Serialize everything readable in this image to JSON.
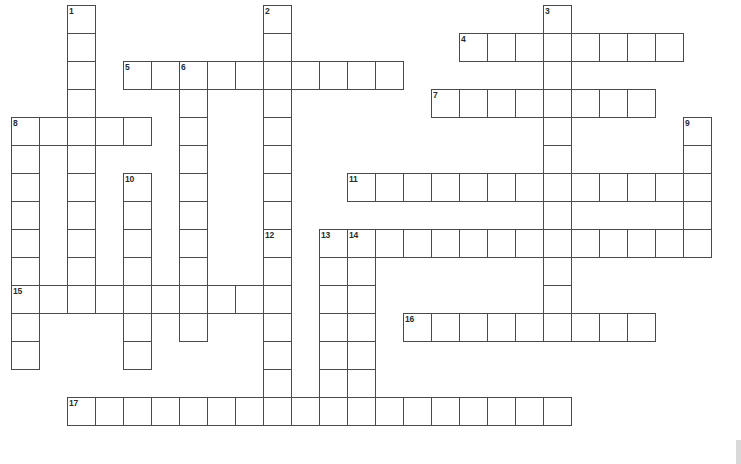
{
  "puzzle": {
    "title": "Crossword Puzzle Grid",
    "kind": "crossword-grid",
    "width_px": 741,
    "height_px": 464,
    "cell_size_px": 28,
    "origin_x_px": 11,
    "origin_y_px": 5,
    "columns": 26,
    "rows": 16,
    "background_color": "#ffffff",
    "grid_line_color": "#4a4a4a",
    "number_color": "#2b2b2b",
    "total_clue_numbers": 17,
    "entries": [
      {
        "number": "1",
        "direction": "down",
        "col": 3,
        "row": 1,
        "length": 8
      },
      {
        "number": "2",
        "direction": "down",
        "col": 10,
        "row": 1,
        "length": 7
      },
      {
        "number": "3",
        "direction": "down",
        "col": 20,
        "row": 1,
        "length": 10
      },
      {
        "number": "4",
        "direction": "across",
        "col": 17,
        "row": 2,
        "length": 8
      },
      {
        "number": "5",
        "direction": "across",
        "col": 5,
        "row": 3,
        "length": 10
      },
      {
        "number": "6",
        "direction": "down",
        "col": 7,
        "row": 3,
        "length": 9
      },
      {
        "number": "7",
        "direction": "across",
        "col": 16,
        "row": 4,
        "length": 8
      },
      {
        "number": "8",
        "direction": "across",
        "col": 1,
        "row": 5,
        "length": 5
      },
      {
        "number": "8",
        "direction": "down",
        "col": 1,
        "row": 5,
        "length": 8
      },
      {
        "number": "9",
        "direction": "down",
        "col": 25,
        "row": 5,
        "length": 5
      },
      {
        "number": "10",
        "direction": "down",
        "col": 5,
        "row": 6,
        "length": 7
      },
      {
        "number": "11",
        "direction": "across",
        "col": 13,
        "row": 7,
        "length": 12
      },
      {
        "number": "12",
        "direction": "down",
        "col": 10,
        "row": 9,
        "length": 8
      },
      {
        "number": "13",
        "direction": "down",
        "col": 12,
        "row": 9,
        "length": 8
      },
      {
        "number": "14",
        "direction": "across",
        "col": 13,
        "row": 9,
        "length": 13
      },
      {
        "number": "14",
        "direction": "down",
        "col": 13,
        "row": 9,
        "length": 8
      },
      {
        "number": "15",
        "direction": "across",
        "col": 1,
        "row": 11,
        "length": 10
      },
      {
        "number": "16",
        "direction": "across",
        "col": 15,
        "row": 12,
        "length": 9
      },
      {
        "number": "17",
        "direction": "across",
        "col": 3,
        "row": 15,
        "length": 18
      }
    ],
    "cells": [
      {
        "col": 3,
        "row": 1,
        "number": "1"
      },
      {
        "col": 10,
        "row": 1,
        "number": "2"
      },
      {
        "col": 20,
        "row": 1,
        "number": "3"
      },
      {
        "col": 3,
        "row": 2
      },
      {
        "col": 10,
        "row": 2
      },
      {
        "col": 20,
        "row": 2
      },
      {
        "col": 17,
        "row": 2,
        "number": "4"
      },
      {
        "col": 18,
        "row": 2
      },
      {
        "col": 19,
        "row": 2
      },
      {
        "col": 21,
        "row": 2
      },
      {
        "col": 22,
        "row": 2
      },
      {
        "col": 23,
        "row": 2
      },
      {
        "col": 24,
        "row": 2
      },
      {
        "col": 3,
        "row": 3
      },
      {
        "col": 5,
        "row": 3,
        "number": "5"
      },
      {
        "col": 6,
        "row": 3
      },
      {
        "col": 7,
        "row": 3,
        "number": "6"
      },
      {
        "col": 8,
        "row": 3
      },
      {
        "col": 9,
        "row": 3
      },
      {
        "col": 10,
        "row": 3
      },
      {
        "col": 11,
        "row": 3
      },
      {
        "col": 12,
        "row": 3
      },
      {
        "col": 13,
        "row": 3
      },
      {
        "col": 14,
        "row": 3
      },
      {
        "col": 20,
        "row": 3
      },
      {
        "col": 3,
        "row": 4
      },
      {
        "col": 7,
        "row": 4
      },
      {
        "col": 10,
        "row": 4
      },
      {
        "col": 16,
        "row": 4,
        "number": "7"
      },
      {
        "col": 17,
        "row": 4
      },
      {
        "col": 18,
        "row": 4
      },
      {
        "col": 19,
        "row": 4
      },
      {
        "col": 20,
        "row": 4
      },
      {
        "col": 21,
        "row": 4
      },
      {
        "col": 22,
        "row": 4
      },
      {
        "col": 23,
        "row": 4
      },
      {
        "col": 1,
        "row": 5,
        "number": "8"
      },
      {
        "col": 2,
        "row": 5
      },
      {
        "col": 3,
        "row": 5
      },
      {
        "col": 4,
        "row": 5
      },
      {
        "col": 5,
        "row": 5
      },
      {
        "col": 7,
        "row": 5
      },
      {
        "col": 10,
        "row": 5
      },
      {
        "col": 20,
        "row": 5
      },
      {
        "col": 25,
        "row": 5,
        "number": "9"
      },
      {
        "col": 1,
        "row": 6
      },
      {
        "col": 3,
        "row": 6
      },
      {
        "col": 7,
        "row": 6
      },
      {
        "col": 10,
        "row": 6
      },
      {
        "col": 20,
        "row": 6
      },
      {
        "col": 25,
        "row": 6
      },
      {
        "col": 1,
        "row": 7
      },
      {
        "col": 3,
        "row": 7
      },
      {
        "col": 5,
        "row": 7,
        "number": "10"
      },
      {
        "col": 7,
        "row": 7
      },
      {
        "col": 10,
        "row": 7
      },
      {
        "col": 13,
        "row": 7,
        "number": "11"
      },
      {
        "col": 14,
        "row": 7
      },
      {
        "col": 15,
        "row": 7
      },
      {
        "col": 16,
        "row": 7
      },
      {
        "col": 17,
        "row": 7
      },
      {
        "col": 18,
        "row": 7
      },
      {
        "col": 19,
        "row": 7
      },
      {
        "col": 20,
        "row": 7
      },
      {
        "col": 21,
        "row": 7
      },
      {
        "col": 22,
        "row": 7
      },
      {
        "col": 23,
        "row": 7
      },
      {
        "col": 24,
        "row": 7
      },
      {
        "col": 25,
        "row": 7
      },
      {
        "col": 1,
        "row": 8
      },
      {
        "col": 3,
        "row": 8
      },
      {
        "col": 5,
        "row": 8
      },
      {
        "col": 7,
        "row": 8
      },
      {
        "col": 10,
        "row": 8
      },
      {
        "col": 20,
        "row": 8
      },
      {
        "col": 25,
        "row": 8
      },
      {
        "col": 1,
        "row": 9
      },
      {
        "col": 3,
        "row": 9
      },
      {
        "col": 5,
        "row": 9
      },
      {
        "col": 7,
        "row": 9
      },
      {
        "col": 10,
        "row": 9,
        "number": "12"
      },
      {
        "col": 12,
        "row": 9,
        "number": "13"
      },
      {
        "col": 13,
        "row": 9,
        "number": "14"
      },
      {
        "col": 14,
        "row": 9
      },
      {
        "col": 15,
        "row": 9
      },
      {
        "col": 16,
        "row": 9
      },
      {
        "col": 17,
        "row": 9
      },
      {
        "col": 18,
        "row": 9
      },
      {
        "col": 19,
        "row": 9
      },
      {
        "col": 20,
        "row": 9
      },
      {
        "col": 21,
        "row": 9
      },
      {
        "col": 22,
        "row": 9
      },
      {
        "col": 23,
        "row": 9
      },
      {
        "col": 24,
        "row": 9
      },
      {
        "col": 25,
        "row": 9
      },
      {
        "col": 1,
        "row": 10
      },
      {
        "col": 3,
        "row": 10
      },
      {
        "col": 5,
        "row": 10
      },
      {
        "col": 7,
        "row": 10
      },
      {
        "col": 10,
        "row": 10
      },
      {
        "col": 12,
        "row": 10
      },
      {
        "col": 13,
        "row": 10
      },
      {
        "col": 20,
        "row": 10
      },
      {
        "col": 1,
        "row": 11,
        "number": "15"
      },
      {
        "col": 2,
        "row": 11
      },
      {
        "col": 3,
        "row": 11
      },
      {
        "col": 4,
        "row": 11
      },
      {
        "col": 5,
        "row": 11
      },
      {
        "col": 6,
        "row": 11
      },
      {
        "col": 7,
        "row": 11
      },
      {
        "col": 8,
        "row": 11
      },
      {
        "col": 9,
        "row": 11
      },
      {
        "col": 10,
        "row": 11
      },
      {
        "col": 12,
        "row": 11
      },
      {
        "col": 13,
        "row": 11
      },
      {
        "col": 20,
        "row": 11
      },
      {
        "col": 1,
        "row": 12
      },
      {
        "col": 5,
        "row": 12
      },
      {
        "col": 7,
        "row": 12
      },
      {
        "col": 10,
        "row": 12
      },
      {
        "col": 12,
        "row": 12
      },
      {
        "col": 13,
        "row": 12
      },
      {
        "col": 15,
        "row": 12,
        "number": "16"
      },
      {
        "col": 16,
        "row": 12
      },
      {
        "col": 17,
        "row": 12
      },
      {
        "col": 18,
        "row": 12
      },
      {
        "col": 19,
        "row": 12
      },
      {
        "col": 20,
        "row": 12
      },
      {
        "col": 21,
        "row": 12
      },
      {
        "col": 22,
        "row": 12
      },
      {
        "col": 23,
        "row": 12
      },
      {
        "col": 1,
        "row": 13
      },
      {
        "col": 5,
        "row": 13
      },
      {
        "col": 10,
        "row": 13
      },
      {
        "col": 12,
        "row": 13
      },
      {
        "col": 13,
        "row": 13
      },
      {
        "col": 10,
        "row": 14
      },
      {
        "col": 12,
        "row": 14
      },
      {
        "col": 13,
        "row": 14
      },
      {
        "col": 3,
        "row": 15,
        "number": "17"
      },
      {
        "col": 4,
        "row": 15
      },
      {
        "col": 5,
        "row": 15
      },
      {
        "col": 6,
        "row": 15
      },
      {
        "col": 7,
        "row": 15
      },
      {
        "col": 8,
        "row": 15
      },
      {
        "col": 9,
        "row": 15
      },
      {
        "col": 10,
        "row": 15
      },
      {
        "col": 11,
        "row": 15
      },
      {
        "col": 12,
        "row": 15
      },
      {
        "col": 13,
        "row": 15
      },
      {
        "col": 14,
        "row": 15
      },
      {
        "col": 15,
        "row": 15
      },
      {
        "col": 16,
        "row": 15
      },
      {
        "col": 17,
        "row": 15
      },
      {
        "col": 18,
        "row": 15
      },
      {
        "col": 19,
        "row": 15
      },
      {
        "col": 20,
        "row": 15
      }
    ]
  }
}
